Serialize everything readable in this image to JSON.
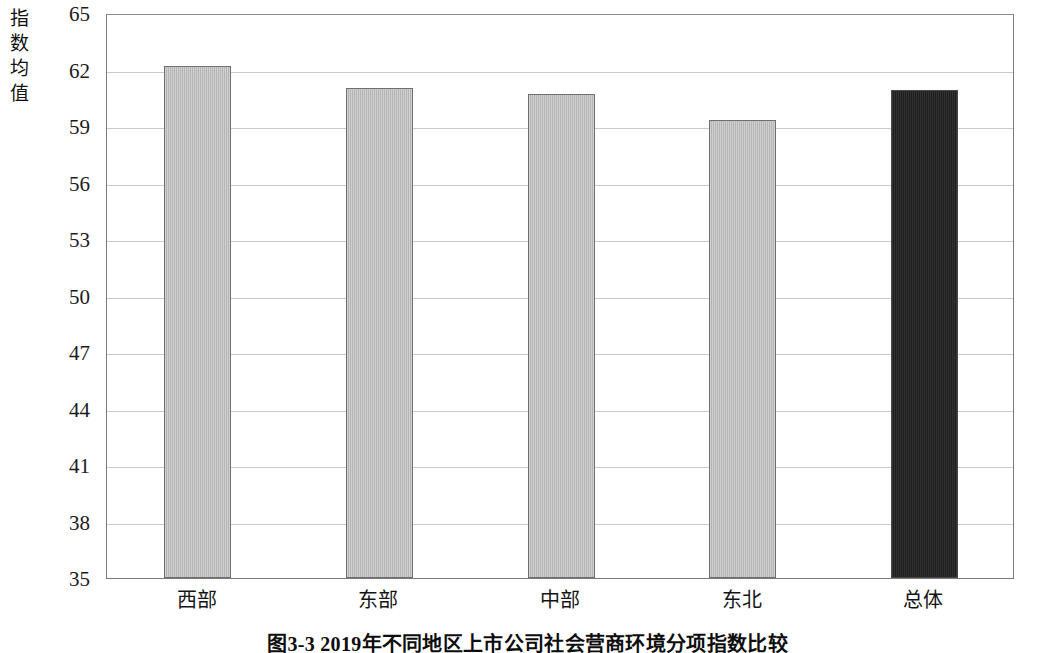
{
  "figure": {
    "caption": "图3-3  2019年不同地区上市公司社会营商环境分项指数比较",
    "y_axis_title_chars": [
      "指",
      "数",
      "均",
      "值"
    ]
  },
  "chart_data": {
    "type": "bar",
    "title": "图3-3  2019年不同地区上市公司社会营商环境分项指数比较",
    "xlabel": "",
    "ylabel": "指数均值",
    "categories": [
      "西部",
      "东部",
      "中部",
      "东北",
      "总体"
    ],
    "values": [
      62.2,
      61.0,
      60.7,
      59.3,
      60.9
    ],
    "series": [
      {
        "name": "指数均值",
        "values": [
          62.2,
          61.0,
          60.7,
          59.3,
          60.9
        ]
      }
    ],
    "bar_colors": [
      "#bcbcbc",
      "#bcbcbc",
      "#bcbcbc",
      "#bcbcbc",
      "#262626"
    ],
    "ylim": [
      35,
      65
    ],
    "yticks": [
      35,
      38,
      41,
      44,
      47,
      50,
      53,
      56,
      59,
      62,
      65
    ],
    "ytick_labels": [
      "35",
      "38",
      "41",
      "44",
      "47",
      "50",
      "53",
      "56",
      "59",
      "62",
      "65"
    ],
    "grid": true,
    "grid_axis": "y",
    "legend": false,
    "legend_position": "none"
  },
  "style": {
    "gray_bar": "#bcbcbc",
    "dark_bar": "#262626",
    "bar_border": "#6f6f6f",
    "gridline": "#c9c9c9",
    "frame": "#7a7a7a",
    "background": "#ffffff",
    "text": "#111111"
  }
}
